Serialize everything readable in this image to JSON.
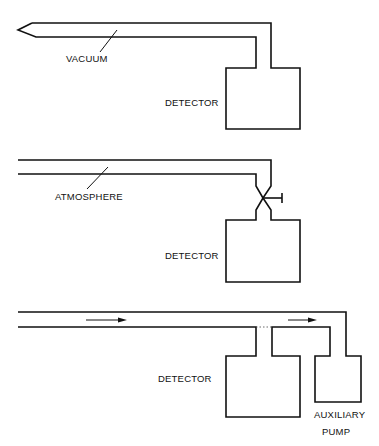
{
  "diagram": {
    "panels": [
      {
        "id": "vacuum-probe",
        "pipe_label": "VACUUM",
        "detector_label": "DETECTOR"
      },
      {
        "id": "atmosphere-probe",
        "pipe_label": "ATMOSPHERE",
        "detector_label": "DETECTOR",
        "valve": "throttle-valve"
      },
      {
        "id": "auxiliary-pump-flow",
        "detector_label": "DETECTOR",
        "pump_label_line1": "AUXILIARY",
        "pump_label_line2": "PUMP",
        "flow_arrows": 2
      }
    ]
  }
}
